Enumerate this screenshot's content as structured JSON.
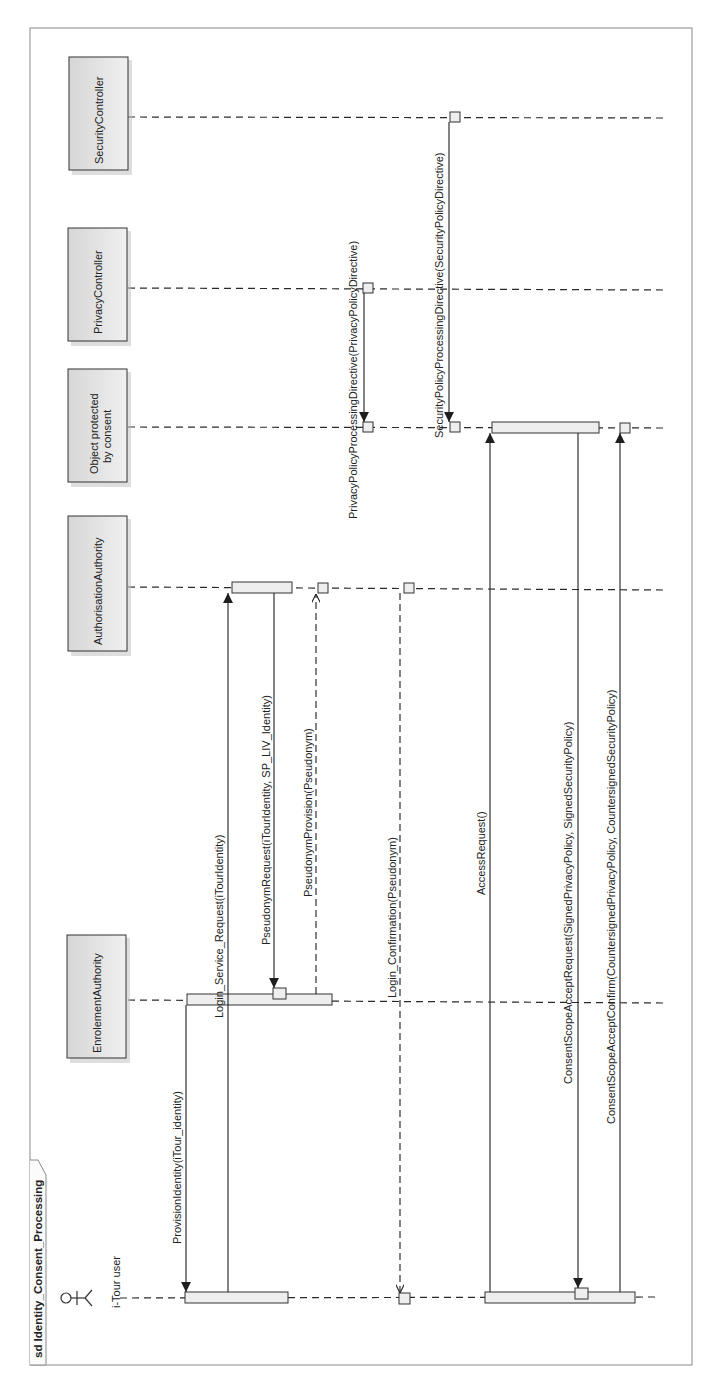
{
  "diagram": {
    "type": "UML sequence diagram (rotated 90° counter-clockwise)",
    "frame_title": "sd Identity_Consent_Processing",
    "participants": [
      {
        "id": "user",
        "label": "i-Tour user",
        "kind": "actor"
      },
      {
        "id": "enrol",
        "label": "EnrolementAuthority",
        "kind": "object"
      },
      {
        "id": "auth",
        "label": "AuthorisationAuthority",
        "kind": "object"
      },
      {
        "id": "obj",
        "label": "Object protected by consent",
        "label_line1": "Object protected",
        "label_line2": "by consent",
        "kind": "object"
      },
      {
        "id": "priv",
        "label": "PrivacyController",
        "kind": "object"
      },
      {
        "id": "sec",
        "label": "SecurityController",
        "kind": "object"
      }
    ],
    "messages": [
      {
        "label": "ProvisionIdentity(iTour_identity)",
        "from": "enrol",
        "to": "user",
        "style": "sync"
      },
      {
        "label": "Login_Service_Request(iTourIdentity)",
        "from": "user",
        "to": "auth",
        "style": "sync"
      },
      {
        "label": "PseudonymRequest(iTourIdentity, SP_LIV_Identity)",
        "from": "auth",
        "to": "enrol",
        "style": "sync"
      },
      {
        "label": "PseudonymProvision(Pseudonym)",
        "from": "enrol",
        "to": "auth",
        "style": "reply"
      },
      {
        "label": "Login_Confirmation(Pseudonym)",
        "from": "auth",
        "to": "user",
        "style": "reply"
      },
      {
        "label": "PrivacyPolicyProcessingDirective(PrivacyPolicyDirective)",
        "from": "priv",
        "to": "obj",
        "style": "sync"
      },
      {
        "label": "SecurityPolicyProcessingDirective(SecurityPolicyDirective)",
        "from": "sec",
        "to": "obj",
        "style": "sync"
      },
      {
        "label": "AccessRequest()",
        "from": "user",
        "to": "obj",
        "style": "sync"
      },
      {
        "label": "ConsentScopeAcceptRequest(SignedPrivacyPolicy, SignedSecurityPolicy)",
        "from": "obj",
        "to": "user",
        "style": "sync"
      },
      {
        "label": "ConsentScopeAcceptConfirm(CountersignedPrivacyPolicy, CountersignedSecurityPolicy)",
        "from": "user",
        "to": "obj",
        "style": "sync"
      }
    ]
  },
  "colors": {
    "line": "#2a2a2a",
    "frame": "#8a8a8a",
    "head_fill": "#e2e2e2",
    "activation_fill": "#eeeeee",
    "background": "#ffffff"
  }
}
